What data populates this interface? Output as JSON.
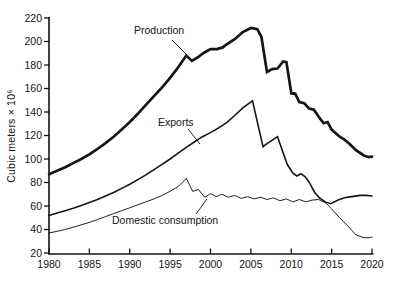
{
  "chart_data": {
    "type": "line",
    "title": "",
    "y_axis_label": "Cubic meters × 10⁶",
    "xlabel": "",
    "xlim": [
      1980,
      2020
    ],
    "ylim": [
      20,
      220
    ],
    "x_ticks": [
      1980,
      1985,
      1990,
      1995,
      2000,
      2005,
      2010,
      2015,
      2020
    ],
    "y_ticks": [
      20,
      40,
      60,
      80,
      100,
      120,
      140,
      160,
      180,
      200,
      220
    ],
    "grid": false,
    "legend_position": "inline-annotations",
    "line_color": "#151515",
    "series": [
      {
        "name": "Production",
        "stroke_width": 2.7,
        "points": [
          [
            1980,
            87
          ],
          [
            1981,
            90
          ],
          [
            1982,
            93
          ],
          [
            1983,
            96.5
          ],
          [
            1984,
            100
          ],
          [
            1985,
            104
          ],
          [
            1986,
            108.5
          ],
          [
            1987,
            113.5
          ],
          [
            1988,
            119
          ],
          [
            1989,
            125
          ],
          [
            1990,
            131.5
          ],
          [
            1991,
            138.5
          ],
          [
            1992,
            146
          ],
          [
            1993,
            153.5
          ],
          [
            1994,
            161
          ],
          [
            1995,
            169
          ],
          [
            1996,
            178
          ],
          [
            1997,
            188
          ],
          [
            1997.7,
            183.5
          ],
          [
            1998.5,
            187
          ],
          [
            1999.2,
            190.5
          ],
          [
            2000,
            193.5
          ],
          [
            2000.8,
            193.5
          ],
          [
            2001.5,
            195
          ],
          [
            2002,
            197.5
          ],
          [
            2003,
            202
          ],
          [
            2004,
            208
          ],
          [
            2005,
            211.5
          ],
          [
            2005.8,
            210.5
          ],
          [
            2006.3,
            204
          ],
          [
            2007,
            174
          ],
          [
            2007.6,
            176.5
          ],
          [
            2008.3,
            177
          ],
          [
            2009,
            183
          ],
          [
            2009.4,
            182.5
          ],
          [
            2010,
            156
          ],
          [
            2010.5,
            155.5
          ],
          [
            2011,
            148.5
          ],
          [
            2011.6,
            147.5
          ],
          [
            2012.2,
            143
          ],
          [
            2012.8,
            142
          ],
          [
            2013.4,
            136
          ],
          [
            2014,
            130.5
          ],
          [
            2014.5,
            131.5
          ],
          [
            2015,
            125
          ],
          [
            2016,
            119
          ],
          [
            2016.6,
            116.5
          ],
          [
            2017.2,
            113
          ],
          [
            2018,
            107.5
          ],
          [
            2019,
            103
          ],
          [
            2019.6,
            101.5
          ],
          [
            2020,
            102
          ]
        ]
      },
      {
        "name": "Exports",
        "stroke_width": 1.6,
        "points": [
          [
            1980,
            52
          ],
          [
            1981,
            54
          ],
          [
            1982,
            56
          ],
          [
            1983,
            58
          ],
          [
            1984,
            60.5
          ],
          [
            1985,
            63
          ],
          [
            1986,
            65.5
          ],
          [
            1987,
            68.5
          ],
          [
            1988,
            71.5
          ],
          [
            1989,
            75
          ],
          [
            1990,
            78.5
          ],
          [
            1991,
            82.5
          ],
          [
            1992,
            86.5
          ],
          [
            1993,
            91
          ],
          [
            1994,
            95.5
          ],
          [
            1995,
            100
          ],
          [
            1996,
            105
          ],
          [
            1997,
            110
          ],
          [
            1998,
            114.5
          ],
          [
            1999,
            119
          ],
          [
            2000,
            122.5
          ],
          [
            2001,
            126.5
          ],
          [
            2002,
            131
          ],
          [
            2003,
            137
          ],
          [
            2004,
            143.5
          ],
          [
            2005.2,
            149.5
          ],
          [
            2006.5,
            110.5
          ],
          [
            2007,
            113
          ],
          [
            2008.3,
            119
          ],
          [
            2009.5,
            95.5
          ],
          [
            2010.2,
            88
          ],
          [
            2010.7,
            85.5
          ],
          [
            2011.2,
            87.5
          ],
          [
            2011.7,
            85
          ],
          [
            2012.2,
            80.5
          ],
          [
            2012.9,
            71.5
          ],
          [
            2013.5,
            67
          ],
          [
            2014.2,
            63.5
          ],
          [
            2014.9,
            62
          ],
          [
            2015.8,
            65
          ],
          [
            2016.6,
            67
          ],
          [
            2017.5,
            68
          ],
          [
            2018.5,
            69
          ],
          [
            2019.3,
            69
          ],
          [
            2020,
            68.5
          ]
        ]
      },
      {
        "name": "Domestic consumption",
        "stroke_width": 0.95,
        "points": [
          [
            1980,
            37
          ],
          [
            1981,
            38.5
          ],
          [
            1982,
            40
          ],
          [
            1983,
            42
          ],
          [
            1984,
            44
          ],
          [
            1985,
            46
          ],
          [
            1986,
            48.5
          ],
          [
            1987,
            51
          ],
          [
            1988,
            53.5
          ],
          [
            1989,
            56
          ],
          [
            1990,
            58.5
          ],
          [
            1991,
            61
          ],
          [
            1992,
            63.5
          ],
          [
            1993,
            66
          ],
          [
            1994,
            69
          ],
          [
            1995,
            72.5
          ],
          [
            1996,
            76.5
          ],
          [
            1997,
            83.5
          ],
          [
            1997.8,
            72.5
          ],
          [
            1998.5,
            74
          ],
          [
            1999.3,
            67.5
          ],
          [
            2000,
            70.5
          ],
          [
            2000.7,
            68
          ],
          [
            2001.4,
            70
          ],
          [
            2002.2,
            67.5
          ],
          [
            2003,
            69
          ],
          [
            2003.8,
            66.5
          ],
          [
            2004.6,
            68
          ],
          [
            2005.4,
            66
          ],
          [
            2006.2,
            67.5
          ],
          [
            2007,
            65.5
          ],
          [
            2007.8,
            67
          ],
          [
            2008.6,
            64.5
          ],
          [
            2009.4,
            66
          ],
          [
            2010.2,
            63.5
          ],
          [
            2011,
            65.5
          ],
          [
            2011.8,
            63.5
          ],
          [
            2012.6,
            65
          ],
          [
            2013.4,
            65.5
          ],
          [
            2014.3,
            62.5
          ],
          [
            2015,
            57.5
          ],
          [
            2016,
            50
          ],
          [
            2017,
            43
          ],
          [
            2018,
            35.5
          ],
          [
            2019,
            33
          ],
          [
            2019.7,
            33
          ],
          [
            2020,
            33.5
          ]
        ]
      }
    ],
    "annotations": [
      {
        "text": "Production",
        "label_pos": [
          134,
          24
        ],
        "leader": [
          172,
          40,
          186,
          54
        ]
      },
      {
        "text": "Exports",
        "label_pos": [
          158,
          116
        ],
        "leader": [
          188,
          129,
          200,
          144
        ]
      },
      {
        "text": "Domestic consumption",
        "label_pos": [
          112,
          214
        ],
        "leader": [
          196,
          214,
          207,
          199
        ]
      }
    ]
  }
}
